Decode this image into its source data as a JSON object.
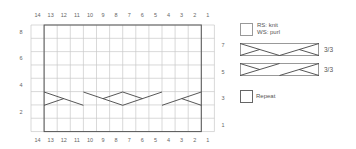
{
  "chart": {
    "columns": 14,
    "rows": 8,
    "top_col_labels": [
      "14",
      "13",
      "12",
      "11",
      "10",
      "9",
      "8",
      "7",
      "6",
      "5",
      "4",
      "3",
      "2",
      "1"
    ],
    "bottom_col_labels": [
      "14",
      "13",
      "12",
      "11",
      "10",
      "9",
      "8",
      "7",
      "6",
      "5",
      "4",
      "3",
      "2",
      "1"
    ],
    "left_row_labels": [
      "8",
      "6",
      "4",
      "2"
    ],
    "right_row_labels": [
      "7",
      "5",
      "3",
      "1"
    ],
    "repeat_columns": "13-2",
    "cable_row": 3,
    "colors": {
      "grid": "#c8c8c8",
      "repeat_outline": "#555555",
      "cable_line": "#444444",
      "background": "#ffffff"
    }
  },
  "legend": {
    "items": [
      {
        "symbol": "plain-square",
        "label_line1": "RS: knit",
        "label_line2": "WS: purl"
      },
      {
        "symbol": "cable-right-cross",
        "ratio": "3/3"
      },
      {
        "symbol": "cable-left-cross",
        "ratio": "3/3"
      },
      {
        "symbol": "repeat-box",
        "label": "Repeat"
      }
    ]
  }
}
